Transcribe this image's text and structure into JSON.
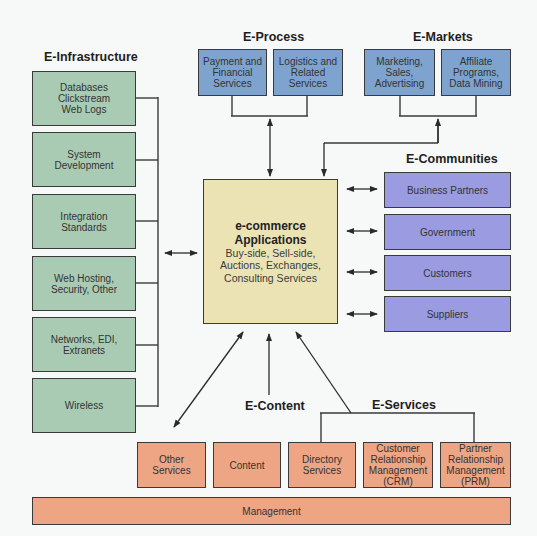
{
  "e_infrastructure": {
    "title": "E-Infrastructure",
    "items": [
      {
        "label": "Databases\nClickstream\nWeb Logs"
      },
      {
        "label": "System\nDevelopment"
      },
      {
        "label": "Integration\nStandards"
      },
      {
        "label": "Web Hosting,\nSecurity, Other"
      },
      {
        "label": "Networks, EDI,\nExtranets"
      },
      {
        "label": "Wireless"
      }
    ]
  },
  "e_process": {
    "title": "E-Process",
    "items": [
      {
        "label": "Payment and\nFinancial\nServices"
      },
      {
        "label": "Logistics and\nRelated\nServices"
      }
    ]
  },
  "e_markets": {
    "title": "E-Markets",
    "items": [
      {
        "label": "Marketing,\nSales,\nAdvertising"
      },
      {
        "label": "Affiliate\nPrograms,\nData Mining"
      }
    ]
  },
  "e_communities": {
    "title": "E-Communities",
    "items": [
      {
        "label": "Business Partners"
      },
      {
        "label": "Government"
      },
      {
        "label": "Customers"
      },
      {
        "label": "Suppliers"
      }
    ]
  },
  "center": {
    "title_line1": "e-commerce",
    "title_line2": "Applications",
    "subtitle": "Buy-side, Sell-side,\nAuctions, Exchanges,\nConsulting Services"
  },
  "e_content": {
    "title": "E-Content"
  },
  "e_services": {
    "title": "E-Services"
  },
  "bottom_row": {
    "items": [
      {
        "label": "Other\nServices"
      },
      {
        "label": "Content"
      },
      {
        "label": "Directory\nServices"
      },
      {
        "label": "Customer\nRelationship\nManagement\n(CRM)"
      },
      {
        "label": "Partner\nRelationship\nManagement\n(PRM)"
      }
    ]
  },
  "management": {
    "label": "Management"
  },
  "colors": {
    "infrastructure": "#a9cbb3",
    "process_markets": "#7ea3cf",
    "communities": "#9a9be0",
    "services": "#eea583",
    "center": "#ece3b5",
    "stroke": "#3a3a3a"
  }
}
